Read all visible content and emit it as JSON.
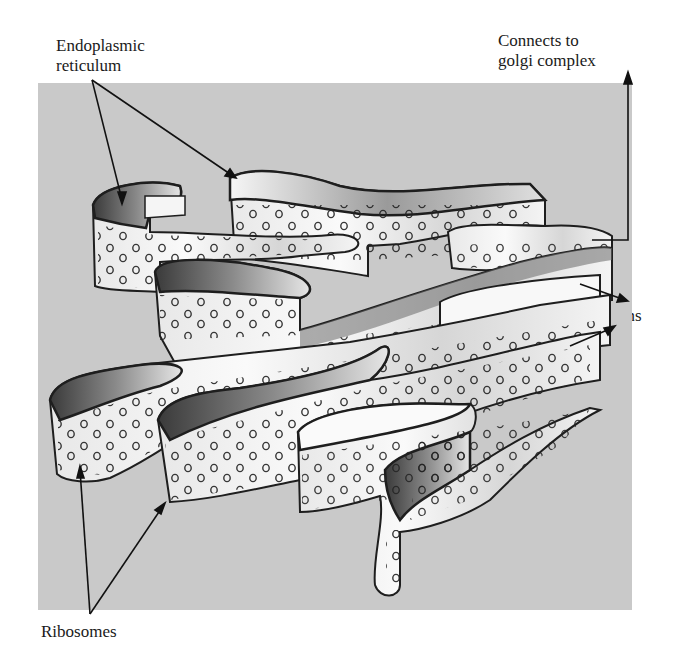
{
  "figure": {
    "background_color": "#c9c9c9",
    "sheet_color": "#f2f2f2",
    "outline_color": "#1e1e1e",
    "labels": {
      "endoplasmic_reticulum": [
        "Endoplasmic",
        "reticulum"
      ],
      "golgi": [
        "Connects to",
        "golgi complex"
      ],
      "proteins": "Proteins",
      "ribosomes": "Ribosomes"
    }
  }
}
